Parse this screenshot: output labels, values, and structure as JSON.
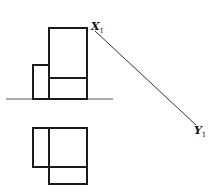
{
  "diagram": {
    "type": "orthographic-projection",
    "background": "#ffffff",
    "stroke_color": "#1a1a1a",
    "labels": {
      "start": {
        "letter": "X",
        "subscript": "1"
      },
      "end": {
        "letter": "Y",
        "subscript": "1"
      }
    },
    "elevation_view": {
      "tall_block": {
        "x": 49,
        "y": 28,
        "w": 38,
        "h": 71,
        "divider_y": 78
      },
      "short_block": {
        "x": 33,
        "y": 65,
        "w": 16,
        "h": 34
      }
    },
    "plan_view": {
      "upper_block": {
        "x": 33,
        "y": 128,
        "w": 54,
        "h": 39,
        "divider_x": 49
      },
      "lower_block": {
        "x": 49,
        "y": 167,
        "w": 38,
        "h": 17
      }
    },
    "ground_line": {
      "x1": 6,
      "y1": 99,
      "x2": 113,
      "y2": 99
    },
    "reference_line": {
      "x1": 95,
      "y1": 31,
      "x2": 196,
      "y2": 125
    }
  }
}
